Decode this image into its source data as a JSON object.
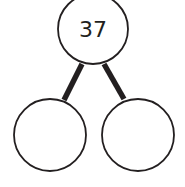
{
  "diagram": {
    "type": "number-bond",
    "whole": {
      "value": "37"
    },
    "parts": [
      {
        "value": ""
      },
      {
        "value": ""
      }
    ],
    "colors": {
      "stroke": "#231f20",
      "fill": "#ffffff"
    }
  }
}
